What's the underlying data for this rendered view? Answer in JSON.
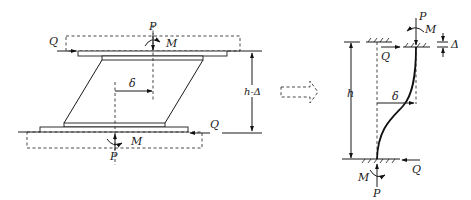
{
  "figure": {
    "left_diagram": {
      "labels": {
        "shear_top": "Q",
        "axial_top": "P",
        "moment_top": "M",
        "displacement": "δ",
        "height": "h-Δ",
        "shear_bottom": "Q",
        "axial_bottom": "P",
        "moment_bottom": "M"
      }
    },
    "transition_arrow": {
      "style": "dashed-outline-right-arrow"
    },
    "right_diagram": {
      "labels": {
        "axial_top": "P",
        "moment_top": "M",
        "shear_top": "Q",
        "vertical_shortening": "Δ",
        "height": "h",
        "displacement": "δ",
        "shear_bottom": "Q",
        "moment_bottom": "M",
        "axial_bottom": "P"
      }
    }
  }
}
